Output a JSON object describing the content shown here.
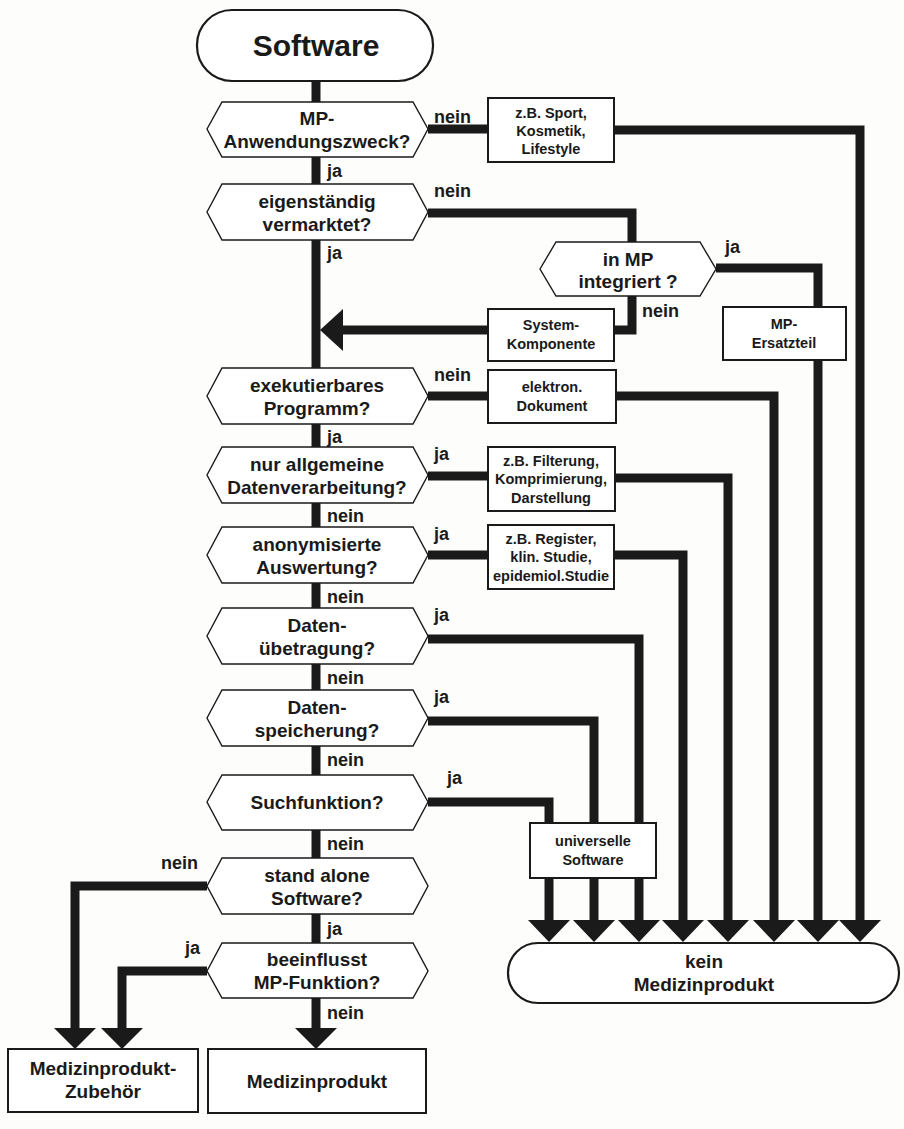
{
  "diagram": {
    "type": "flowchart",
    "colors": {
      "line": "#1a1a1a",
      "fill": "#ffffff",
      "background": "#fdfdfb"
    },
    "start": {
      "label": "Software"
    },
    "decisions": [
      {
        "id": "d1",
        "lines": [
          "MP-",
          "Anwendungszweck?"
        ],
        "exit_right": "nein",
        "exit_down": "ja"
      },
      {
        "id": "d2",
        "lines": [
          "eigenständig",
          "vermarktet?"
        ],
        "exit_right": "nein",
        "exit_down": "ja"
      },
      {
        "id": "d3",
        "lines": [
          "in MP",
          "integriert ?"
        ],
        "exit_right": "ja",
        "exit_down": "nein"
      },
      {
        "id": "d4",
        "lines": [
          "exekutierbares",
          "Programm?"
        ],
        "exit_right": "nein",
        "exit_down": "ja"
      },
      {
        "id": "d5",
        "lines": [
          "nur allgemeine",
          "Datenverarbeitung?"
        ],
        "exit_right": "ja",
        "exit_down": "nein"
      },
      {
        "id": "d6",
        "lines": [
          "anonymisierte",
          "Auswertung?"
        ],
        "exit_right": "ja",
        "exit_down": "nein"
      },
      {
        "id": "d7",
        "lines": [
          "Daten-",
          "übetragung?"
        ],
        "exit_right": "ja",
        "exit_down": "nein"
      },
      {
        "id": "d8",
        "lines": [
          "Daten-",
          "speicherung?"
        ],
        "exit_right": "ja",
        "exit_down": "nein"
      },
      {
        "id": "d9",
        "lines": [
          "Suchfunktion?"
        ],
        "exit_right": "ja",
        "exit_down": "nein"
      },
      {
        "id": "d10",
        "lines": [
          "stand alone",
          "Software?"
        ],
        "exit_left": "nein",
        "exit_down": "ja"
      },
      {
        "id": "d11",
        "lines": [
          "beeinflusst",
          "MP-Funktion?"
        ],
        "exit_left": "ja",
        "exit_down": "nein"
      }
    ],
    "notes": [
      {
        "id": "n1",
        "lines": [
          "z.B. Sport,",
          "Kosmetik,",
          "Lifestyle"
        ]
      },
      {
        "id": "n2",
        "lines": [
          "System-",
          "Komponente"
        ]
      },
      {
        "id": "n3",
        "lines": [
          "MP-",
          "Ersatzteil"
        ]
      },
      {
        "id": "n4",
        "lines": [
          "elektron.",
          "Dokument"
        ]
      },
      {
        "id": "n5",
        "lines": [
          "z.B. Filterung,",
          "Komprimierung,",
          "Darstellung"
        ]
      },
      {
        "id": "n6",
        "lines": [
          "z.B. Register,",
          "klin. Studie,",
          "epidemiol.Studie"
        ]
      },
      {
        "id": "n7",
        "lines": [
          "universelle",
          "Software"
        ]
      }
    ],
    "outcomes": {
      "not_device": {
        "lines": [
          "kein",
          "Medizinprodukt"
        ]
      },
      "accessory": {
        "lines": [
          "Medizinprodukt-",
          "Zubehör"
        ]
      },
      "device": {
        "lines": [
          "Medizinprodukt"
        ]
      }
    }
  }
}
